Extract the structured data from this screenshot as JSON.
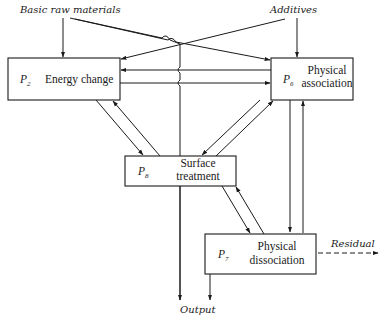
{
  "inputs": {
    "raw_materials": "Basic raw materials",
    "additives": "Additives"
  },
  "outputs": {
    "output": "Output",
    "residual": "Residual"
  },
  "processes": [
    {
      "id_letter": "P",
      "id_sub": "2",
      "name_lines": [
        "Energy change"
      ]
    },
    {
      "id_letter": "P",
      "id_sub": "6",
      "name_lines": [
        "Physical",
        "association"
      ]
    },
    {
      "id_letter": "P",
      "id_sub": "8",
      "name_lines": [
        "Surface",
        "treatment"
      ]
    },
    {
      "id_letter": "P",
      "id_sub": "7",
      "name_lines": [
        "Physical",
        "dissociation"
      ]
    }
  ],
  "colors": {
    "line": "#1a1a1a",
    "background": "#ffffff"
  }
}
